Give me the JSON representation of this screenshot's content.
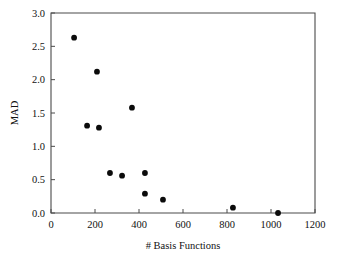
{
  "chart_data": {
    "type": "scatter",
    "title": "",
    "xlabel": "# Basis Functions",
    "ylabel": "MAD",
    "xlim": [
      0,
      1200
    ],
    "ylim": [
      0.0,
      3.0
    ],
    "xticks": [
      0,
      200,
      400,
      600,
      800,
      1000,
      1200
    ],
    "xtick_labels": [
      "0",
      "200",
      "400",
      "600",
      "800",
      "1000",
      "1200"
    ],
    "yticks": [
      0.0,
      0.5,
      1.0,
      1.5,
      2.0,
      2.5,
      3.0
    ],
    "ytick_labels": [
      "0.0",
      "0.5",
      "1.0",
      "1.5",
      "2.0",
      "2.5",
      "3.0"
    ],
    "grid": false,
    "legend": null,
    "marker": "filled-circle",
    "marker_color": "#0b0b0b",
    "axis_color": "#4a4a4a",
    "x": [
      105,
      209,
      368,
      164,
      218,
      268,
      323,
      427,
      427,
      509,
      827,
      1032
    ],
    "y": [
      2.63,
      2.12,
      1.58,
      1.31,
      1.28,
      0.6,
      0.56,
      0.6,
      0.29,
      0.2,
      0.08,
      0.0
    ],
    "points": [
      {
        "x": 105,
        "y": 2.63
      },
      {
        "x": 209,
        "y": 2.12
      },
      {
        "x": 368,
        "y": 1.58
      },
      {
        "x": 164,
        "y": 1.31
      },
      {
        "x": 218,
        "y": 1.28
      },
      {
        "x": 268,
        "y": 0.6
      },
      {
        "x": 323,
        "y": 0.56
      },
      {
        "x": 427,
        "y": 0.6
      },
      {
        "x": 427,
        "y": 0.29
      },
      {
        "x": 509,
        "y": 0.2
      },
      {
        "x": 827,
        "y": 0.08
      },
      {
        "x": 1032,
        "y": 0.0
      }
    ]
  },
  "axes": {
    "y_title": "MAD",
    "x_title": "# Basis Functions"
  }
}
